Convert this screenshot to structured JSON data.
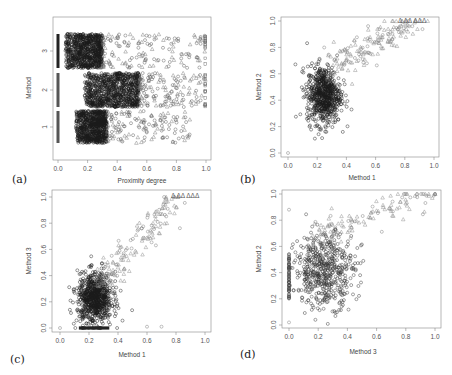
{
  "chart_data": [
    {
      "id": "a",
      "panel_label": "(a)",
      "type": "scatter",
      "title": "",
      "xlabel": "Proximity degree",
      "ylabel": "Method",
      "xlim": [
        0,
        1
      ],
      "xticks": [
        "0.0",
        "0.2",
        "0.4",
        "0.6",
        "0.8",
        "1.0"
      ],
      "yticks": [
        "1",
        "2",
        "3"
      ],
      "categories": [
        "1",
        "2",
        "3"
      ],
      "grid": false,
      "legend": null,
      "description": "Jittered strip chart of proximity degree per method; dense circle clusters near 0.1-0.3, sparser triangles at higher values, a solid column of points at 0.0 and squares near 1.0",
      "series": [
        {
          "name": "Method 1",
          "y": 1,
          "dense_range": [
            0.12,
            0.33
          ],
          "sparse_range": [
            0.33,
            0.9
          ],
          "zero_column": true
        },
        {
          "name": "Method 2",
          "y": 2,
          "dense_range": [
            0.18,
            0.55
          ],
          "sparse_range": [
            0.55,
            1.0
          ],
          "zero_column": true
        },
        {
          "name": "Method 3",
          "y": 3,
          "dense_range": [
            0.05,
            0.3
          ],
          "sparse_range": [
            0.3,
            1.0
          ],
          "zero_column": true
        }
      ]
    },
    {
      "id": "b",
      "panel_label": "(b)",
      "type": "scatter",
      "title": "",
      "xlabel": "Method 1",
      "ylabel": "Method 2",
      "xlim": [
        0,
        1
      ],
      "ylim": [
        0,
        1
      ],
      "xticks": [
        "0.0",
        "0.2",
        "0.4",
        "0.6",
        "0.8",
        "1.0"
      ],
      "yticks": [
        "0.0",
        "0.2",
        "0.4",
        "0.6",
        "0.8",
        "1.0"
      ],
      "grid": false,
      "annotation": "Δ ΔΔ ΔΔΔ",
      "description": "Dense cluster of circles around x 0.13-0.35, y 0.22-0.65; sparse triangles trending up to (0.85, 0.97); single point at (0,0)",
      "clusters": [
        {
          "shape": "circle",
          "n": 700,
          "x": [
            0.13,
            0.36
          ],
          "y": [
            0.22,
            0.66
          ],
          "density": "high"
        },
        {
          "shape": "triangle",
          "n": 160,
          "x": [
            0.3,
            0.88
          ],
          "y": [
            0.6,
            1.0
          ],
          "density": "low"
        }
      ],
      "outliers": [
        {
          "x": 0.0,
          "y": 0.0
        }
      ]
    },
    {
      "id": "c",
      "panel_label": "(c)",
      "type": "scatter",
      "title": "",
      "xlabel": "Method 1",
      "ylabel": "Method 3",
      "xlim": [
        0,
        1
      ],
      "ylim": [
        0,
        1
      ],
      "xticks": [
        "0.0",
        "0.2",
        "0.4",
        "0.6",
        "0.8",
        "1.0"
      ],
      "yticks": [
        "0.0",
        "0.2",
        "0.4",
        "0.6",
        "0.8",
        "1.0"
      ],
      "grid": false,
      "annotation": "Δ ΔΔ ΔΔΔ",
      "description": "Dense circles around x 0.12-0.35, y 0.05-0.4 with a solid row at y=0; sparse triangles rising to (0.75, 1.0)",
      "clusters": [
        {
          "shape": "circle",
          "n": 800,
          "x": [
            0.12,
            0.36
          ],
          "y": [
            0.03,
            0.42
          ],
          "density": "high"
        },
        {
          "shape": "triangle",
          "n": 150,
          "x": [
            0.3,
            0.78
          ],
          "y": [
            0.2,
            1.0
          ],
          "density": "low"
        }
      ],
      "outliers": [
        {
          "x": 0.0,
          "y": 0.0
        },
        {
          "x": 0.6,
          "y": 0.01
        },
        {
          "x": 0.7,
          "y": 0.01
        }
      ]
    },
    {
      "id": "d",
      "panel_label": "(d)",
      "type": "scatter",
      "title": "",
      "xlabel": "Method 3",
      "ylabel": "Method 2",
      "xlim": [
        0,
        1
      ],
      "ylim": [
        0,
        1
      ],
      "xticks": [
        "0.0",
        "0.2",
        "0.4",
        "0.6",
        "0.8",
        "1.0"
      ],
      "yticks": [
        "0.0",
        "0.2",
        "0.4",
        "0.6",
        "0.8",
        "1.0"
      ],
      "grid": false,
      "description": "Column of points at x=0 spanning y 0.2-0.55; broad circle cloud x 0.05-0.45, y 0.15-0.7; triangles trending up to (1.0, 1.0)",
      "clusters": [
        {
          "shape": "circle",
          "n": 550,
          "x": [
            0.04,
            0.45
          ],
          "y": [
            0.14,
            0.7
          ],
          "density": "medium"
        },
        {
          "shape": "triangle",
          "n": 120,
          "x": [
            0.2,
            1.0
          ],
          "y": [
            0.65,
            1.0
          ],
          "density": "low"
        }
      ],
      "outliers": [
        {
          "x": 0.0,
          "y": 0.02
        },
        {
          "x": 0.0,
          "y": 0.88
        }
      ]
    }
  ]
}
